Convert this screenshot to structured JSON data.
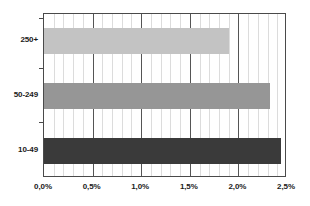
{
  "chart_data": {
    "type": "bar",
    "orientation": "horizontal",
    "title": "",
    "subtitle": "",
    "xlabel": "",
    "ylabel": "",
    "categories": [
      "10-49",
      "50-249",
      "250+"
    ],
    "values": [
      2.44,
      2.32,
      1.9
    ],
    "series": [
      {
        "name": "",
        "values": [
          2.44,
          2.32,
          1.9
        ]
      }
    ],
    "bars": [
      {
        "category": "250+",
        "value": 1.9,
        "value_label": "1,9%",
        "color": "#c3c3c3"
      },
      {
        "category": "50-249",
        "value": 2.32,
        "value_label": "2,32%",
        "color": "#969696"
      },
      {
        "category": "10-49",
        "value": 2.44,
        "value_label": "2,44%",
        "color": "#3a3a3a"
      }
    ],
    "xlim": [
      0,
      2.5
    ],
    "xticks": [
      0,
      0.5,
      1.0,
      1.5,
      2.0,
      2.5
    ],
    "xticklabels": [
      "0,0%",
      "0,5%",
      "1,0%",
      "1,5%",
      "2,0%",
      "2,5%"
    ],
    "yticklabels": [
      "250+",
      "50-249",
      "10-49"
    ],
    "minor_gridlines_per_interval": 5,
    "grid": true,
    "grid_axis": "x",
    "legend": false,
    "legend_position": "none",
    "annotations": [],
    "colors": {
      "bar_light": "#c3c3c3",
      "bar_medium": "#969696",
      "bar_dark": "#3a3a3a",
      "axis": "#4a4a4a",
      "gridline_major": "#555555",
      "gridline_minor": "#dcdcdc",
      "background": "#ffffff",
      "text": "#1a1a1a"
    }
  },
  "axis": {
    "x_tick_labels": [
      {
        "text": "0,0%",
        "value": 0
      },
      {
        "text": "0,5%",
        "value": 0.5
      },
      {
        "text": "1,0%",
        "value": 1.0
      },
      {
        "text": "1,5%",
        "value": 1.5
      },
      {
        "text": "2,0%",
        "value": 2.0
      },
      {
        "text": "2,5%",
        "value": 2.5
      }
    ],
    "y_tick_labels": [
      {
        "text": "250+"
      },
      {
        "text": "50-249"
      },
      {
        "text": "10-49"
      }
    ]
  }
}
